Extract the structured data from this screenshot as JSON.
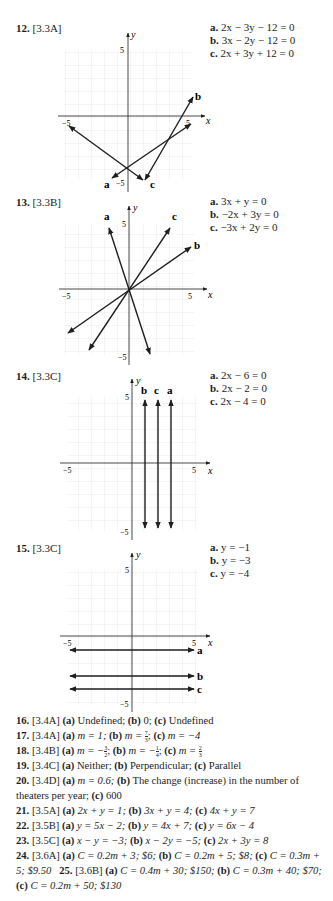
{
  "problems": [
    {
      "number": "12.",
      "section": "[3.3A]",
      "equations": [
        {
          "label": "a.",
          "text": "2x − 3y − 12 = 0"
        },
        {
          "label": "b.",
          "text": "3x − 2y − 12 = 0"
        },
        {
          "label": "c.",
          "text": "2x + 3y + 12 = 0"
        }
      ]
    },
    {
      "number": "13.",
      "section": "[3.3B]",
      "equations": [
        {
          "label": "a.",
          "text": "3x + y = 0"
        },
        {
          "label": "b.",
          "text": "−2x + 3y = 0"
        },
        {
          "label": "c.",
          "text": "−3x + 2y = 0"
        }
      ]
    },
    {
      "number": "14.",
      "section": "[3.3C]",
      "equations": [
        {
          "label": "a.",
          "text": "2x − 6 = 0"
        },
        {
          "label": "b.",
          "text": "2x − 2 = 0"
        },
        {
          "label": "c.",
          "text": "2x − 4 = 0"
        }
      ]
    },
    {
      "number": "15.",
      "section": "[3.3C]",
      "equations": [
        {
          "label": "a.",
          "text": "y = −1"
        },
        {
          "label": "b.",
          "text": "y = −3"
        },
        {
          "label": "c.",
          "text": "y = −4"
        }
      ]
    }
  ],
  "graph_labels": {
    "x_axis": "x",
    "y_axis": "y",
    "tick_pos": "5",
    "tick_neg": "−5",
    "line_a": "a",
    "line_b": "b",
    "line_c": "c"
  },
  "answers": [
    {
      "number": "16.",
      "section": "[3.4A]",
      "text": "(a) Undefined; (b) 0; (c) Undefined"
    },
    {
      "number": "17.",
      "section": "[3.4A]",
      "text": "(a) m = 1; (b) m = 7/3; (c) m = −4"
    },
    {
      "number": "18.",
      "section": "[3.4B]",
      "text": "(a) m = −3/2; (b) m = −1/4; (c) m = 2/3"
    },
    {
      "number": "19.",
      "section": "[3.4C]",
      "text": "(a) Neither; (b) Perpendicular; (c) Parallel"
    },
    {
      "number": "20.",
      "section": "[3.4D]",
      "text": "(a) m = 0.6; (b) The change (increase) in the number of theaters per year; (c) 600"
    },
    {
      "number": "21.",
      "section": "[3.5A]",
      "text": "(a) 2x + y = 1; (b) 3x + y = 4; (c) 4x + y = 7"
    },
    {
      "number": "22.",
      "section": "[3.5B]",
      "text": "(a) y = 5x − 2; (b) y = 4x + 7; (c) y = 6x − 4"
    },
    {
      "number": "23.",
      "section": "[3.5C]",
      "text": "(a) x − y = −3; (b) x − 2y = −5; (c) 2x + 3y = 8"
    },
    {
      "number": "24.",
      "section": "[3.6A]",
      "text": "(a) C = 0.2m + 3; $6; (b) C = 0.2m + 5; $8; (c) C = 0.3m + 5; $9.50"
    },
    {
      "number": "25.",
      "section": "[3.6B]",
      "text": "(a) C = 0.4m + 30; $150; (b) C = 0.3m + 40; $70; (c) C = 0.2m + 50; $130"
    }
  ],
  "answer_parts": {
    "a16": "(a)",
    "a16_1": " Undefined; ",
    "b16": "(b)",
    "b16_1": " 0; ",
    "c16": "(c)",
    "c16_1": " Undefined",
    "a17_1": " m = 1; ",
    "b17_1": " m = ",
    "b17_n": "7",
    "b17_d": "3",
    "c17_1": " m = −4",
    "a18_1": " m = −",
    "a18_n": "3",
    "a18_d": "2",
    "b18_1": " m = −",
    "b18_n": "1",
    "b18_d": "4",
    "c18_1": " m = ",
    "c18_n": "2",
    "c18_d": "3",
    "a19_1": " Neither; ",
    "b19_1": " Perpendicular; ",
    "c19_1": " Parallel",
    "a20_1": " m = 0.6; ",
    "b20_1": " The change (increase) in the number of theaters per year; ",
    "c20_1": " 600",
    "a21_1": " 2x + y = 1; ",
    "b21_1": " 3x + y = 4; ",
    "c21_1": " 4x + y = 7",
    "a22_1": " y = 5x − 2; ",
    "b22_1": " y = 4x + 7; ",
    "c22_1": " y = 6x − 4",
    "a23_1": " x − y = −3; ",
    "b23_1": " x − 2y = −5; ",
    "c23_1": " 2x + 3y = 8",
    "a24_1": " C = 0.2m + 3; $6; ",
    "b24_1": " C = 0.2m + 5; $8;",
    "c24_1": " C = 0.3m + 5; $9.50",
    "a25_1": " C = 0.4m + 30; $150;",
    "b25_1": " C = 0.3m + 40; $70; ",
    "c25_1": " C = 0.2m + 50; $130"
  }
}
